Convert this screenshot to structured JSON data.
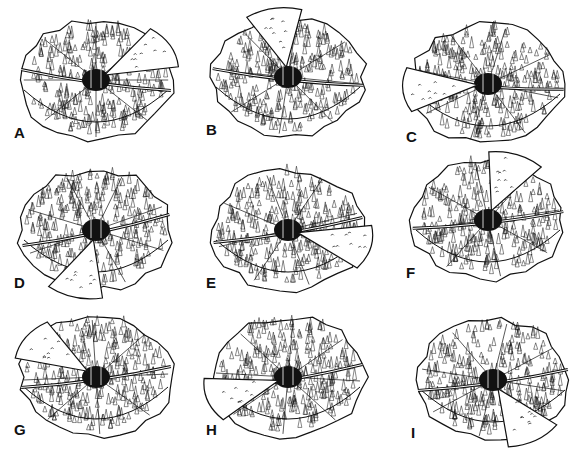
{
  "figure": {
    "panels": [
      {
        "label": "A",
        "x": 8,
        "y": 8,
        "wedge_angle": -30,
        "stream_angle": 10
      },
      {
        "label": "B",
        "x": 200,
        "y": 5,
        "wedge_angle": -100,
        "stream_angle": 8
      },
      {
        "label": "C",
        "x": 400,
        "y": 12,
        "wedge_angle": 175,
        "stream_angle": 5
      },
      {
        "label": "D",
        "x": 8,
        "y": 158,
        "wedge_angle": 105,
        "stream_angle": -15
      },
      {
        "label": "E",
        "x": 200,
        "y": 158,
        "wedge_angle": 15,
        "stream_angle": -12
      },
      {
        "label": "F",
        "x": 400,
        "y": 148,
        "wedge_angle": -70,
        "stream_angle": -8
      },
      {
        "label": "G",
        "x": 8,
        "y": 305,
        "wedge_angle": -145,
        "stream_angle": -10
      },
      {
        "label": "H",
        "x": 200,
        "y": 305,
        "wedge_angle": 160,
        "stream_angle": -12
      },
      {
        "label": "I",
        "x": 405,
        "y": 308,
        "wedge_angle": 60,
        "stream_angle": -10
      }
    ]
  },
  "colors": {
    "ink": "#111111",
    "paper": "#ffffff",
    "shade": "#9a9a9a"
  }
}
